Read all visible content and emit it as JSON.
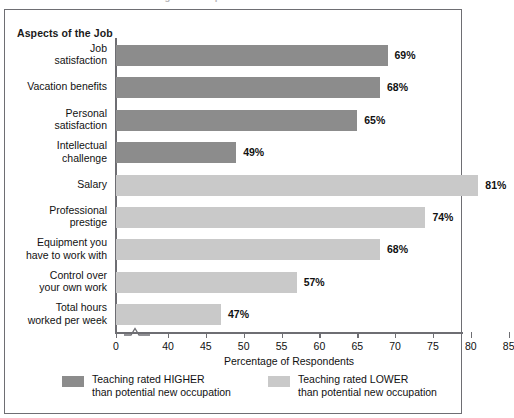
{
  "top_cutoff_text": "Teaching vs. Occupation",
  "chart_data": {
    "type": "bar",
    "orientation": "horizontal",
    "title": "",
    "category_axis_header": "Aspects of the Job",
    "xlabel": "Percentage of Respondents",
    "ylabel": "",
    "xlim": [
      0,
      85
    ],
    "axis_break": "between 0 and 40",
    "grid": false,
    "legend_position": "bottom",
    "categories": [
      "Job\nsatisfaction",
      "Vacation benefits",
      "Personal\nsatisfaction",
      "Intellectual\nchallenge",
      "Salary",
      "Professional\nprestige",
      "Equipment you\nhave to work with",
      "Control over\nyour own work",
      "Total hours\nworked per week"
    ],
    "values": [
      69,
      68,
      65,
      49,
      81,
      74,
      68,
      57,
      47
    ],
    "value_labels": [
      "69%",
      "68%",
      "65%",
      "49%",
      "81%",
      "74%",
      "68%",
      "57%",
      "47%"
    ],
    "series_of_point": [
      "higher",
      "higher",
      "higher",
      "higher",
      "lower",
      "lower",
      "lower",
      "lower",
      "lower"
    ],
    "series": [
      {
        "name": "Teaching rated HIGHER\nthan potential new occupation",
        "key": "higher",
        "color": "#8c8c8c"
      },
      {
        "name": "Teaching rated LOWER\nthan potential new occupation",
        "key": "lower",
        "color": "#c9c9c9"
      }
    ],
    "xticks": [
      0,
      40,
      45,
      50,
      55,
      60,
      65,
      70,
      75,
      80,
      85
    ],
    "xtick_labels": [
      "0",
      "40",
      "45",
      "50",
      "55",
      "60",
      "65",
      "70",
      "75",
      "80",
      "85"
    ]
  },
  "colors": {
    "higher_bar": "#8c8c8c",
    "lower_bar": "#c9c9c9",
    "axis": "#6e6e73",
    "frame": "#6e6e73",
    "text": "#111111",
    "background": "#ffffff"
  }
}
